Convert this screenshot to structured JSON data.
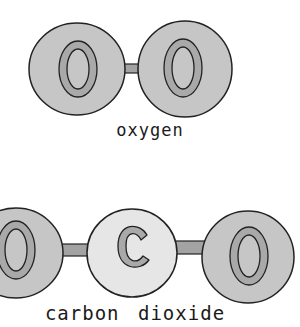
{
  "molecules": [
    {
      "name": "oxygen",
      "atoms": [
        {
          "symbol": "O",
          "fill": "#c6c6c6"
        },
        {
          "symbol": "O",
          "fill": "#c6c6c6"
        }
      ]
    },
    {
      "name": "carbon dioxide",
      "atoms": [
        {
          "symbol": "O",
          "fill": "#c6c6c6"
        },
        {
          "symbol": "C",
          "fill": "#e6e6e6"
        },
        {
          "symbol": "O",
          "fill": "#c6c6c6"
        }
      ]
    }
  ],
  "colors": {
    "oxygen_fill": "#c6c6c6",
    "carbon_fill": "#e6e6e6",
    "letter_fill": "#a9a9a9",
    "bond_fill": "#a3a3a3",
    "outline": "#222222"
  }
}
